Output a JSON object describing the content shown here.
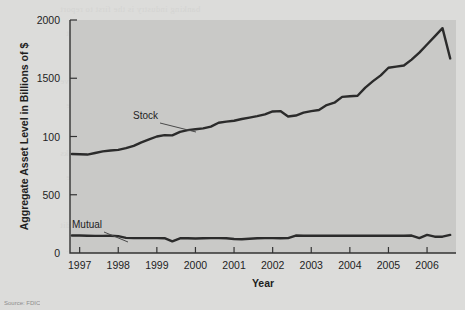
{
  "figure": {
    "source_note": "Source: FDIC",
    "background_color": "#dcdcda",
    "plot_background_color": "#c9c9c7",
    "line_color": "#2b2b2b",
    "axis_color": "#333333"
  },
  "showthrough_text": [
    "banking industry is the first to report",
    "may use the same income statement",
    "operating expenses are deducted to",
    "net income must be evaluated relative",
    "of the bank's balance sheet. This is the",
    "assets and return on equity are the two",
    "measures of bank performance. Banks",
    "with a high return on assets are able",
    "generate earnings from a given level of",
    "while controlling expenses and credit",
    "losses."
  ],
  "chart_data": {
    "type": "line",
    "title": "",
    "xlabel": "Year",
    "ylabel": "Aggregate Asset Level in Billions of $",
    "xlim": [
      1996.75,
      2006.75
    ],
    "ylim": [
      0,
      2000
    ],
    "grid": false,
    "legend": "inline-annotations",
    "y_tick_values": [
      0,
      500,
      1000,
      1500,
      2000
    ],
    "y_tick_labels": [
      "0",
      "500",
      "100",
      "1500",
      "2000"
    ],
    "y_tick_label_note": "The 1000 gridline is printed as '100' in the original figure.",
    "x_tick_labels": [
      "1997",
      "1998",
      "1999",
      "2000",
      "2001",
      "2002",
      "2003",
      "2004",
      "2005",
      "2006"
    ],
    "x_tick_values": [
      1997,
      1998,
      1999,
      2000,
      2001,
      2002,
      2003,
      2004,
      2005,
      2006
    ],
    "series": [
      {
        "name": "Stock",
        "label": "Stock",
        "color": "#2b2b2b",
        "x": [
          1996.8,
          1997.0,
          1997.2,
          1997.4,
          1997.6,
          1997.8,
          1998.0,
          1998.2,
          1998.4,
          1998.6,
          1998.8,
          1999.0,
          1999.2,
          1999.4,
          1999.6,
          1999.8,
          2000.0,
          2000.2,
          2000.4,
          2000.6,
          2000.8,
          2001.0,
          2001.2,
          2001.4,
          2001.6,
          2001.8,
          2002.0,
          2002.2,
          2002.4,
          2002.6,
          2002.8,
          2003.0,
          2003.2,
          2003.4,
          2003.6,
          2003.8,
          2004.0,
          2004.2,
          2004.4,
          2004.6,
          2004.8,
          2005.0,
          2005.2,
          2005.4,
          2005.6,
          2005.8,
          2006.0,
          2006.2,
          2006.4,
          2006.6
        ],
        "y": [
          850,
          848,
          845,
          858,
          872,
          880,
          885,
          900,
          920,
          950,
          975,
          1000,
          1012,
          1010,
          1040,
          1055,
          1062,
          1070,
          1085,
          1118,
          1128,
          1135,
          1150,
          1162,
          1175,
          1190,
          1215,
          1218,
          1172,
          1180,
          1205,
          1218,
          1228,
          1270,
          1290,
          1340,
          1345,
          1350,
          1420,
          1475,
          1525,
          1590,
          1600,
          1610,
          1660,
          1720,
          1790,
          1860,
          1930,
          1670
        ]
      },
      {
        "name": "Mutual",
        "label": "Mutual",
        "color": "#2b2b2b",
        "x": [
          1996.8,
          1997.0,
          1997.2,
          1997.4,
          1997.6,
          1997.8,
          1998.0,
          1998.2,
          1998.4,
          1998.6,
          1998.8,
          1999.0,
          1999.2,
          1999.4,
          1999.6,
          1999.8,
          2000.0,
          2000.2,
          2000.4,
          2000.6,
          2000.8,
          2001.0,
          2001.2,
          2001.4,
          2001.6,
          2001.8,
          2002.0,
          2002.2,
          2002.4,
          2002.6,
          2002.8,
          2003.0,
          2003.2,
          2003.4,
          2003.6,
          2003.8,
          2004.0,
          2004.2,
          2004.4,
          2004.6,
          2004.8,
          2005.0,
          2005.2,
          2005.4,
          2005.6,
          2005.8,
          2006.0,
          2006.2,
          2006.4,
          2006.6
        ],
        "y": [
          150,
          150,
          148,
          147,
          147,
          148,
          145,
          130,
          128,
          128,
          128,
          128,
          127,
          100,
          126,
          126,
          125,
          126,
          128,
          128,
          126,
          120,
          118,
          122,
          126,
          128,
          128,
          127,
          128,
          150,
          148,
          148,
          148,
          148,
          148,
          148,
          148,
          148,
          148,
          148,
          148,
          148,
          148,
          148,
          150,
          128,
          155,
          140,
          140,
          155
        ]
      }
    ],
    "annotations": [
      {
        "text": "Stock",
        "label_x": 2098,
        "label_y": 1235
      },
      {
        "text": "Mutual",
        "label_x": 1997.4,
        "label_y": 430
      }
    ]
  }
}
